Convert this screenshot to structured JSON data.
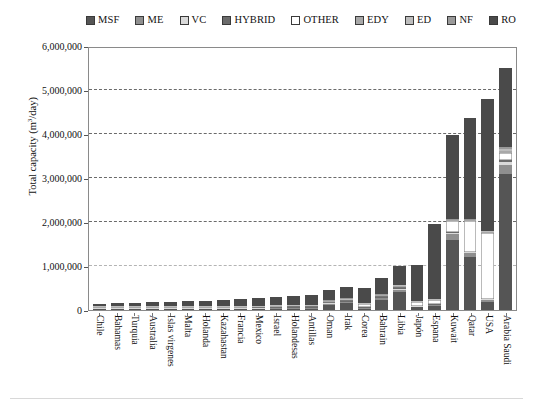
{
  "chart_data": {
    "type": "bar",
    "subtype": "stacked-bar",
    "title": "",
    "xlabel": "",
    "ylabel": "Total capacity (m3/day)",
    "ylabel_display": "Total capacity (m",
    "ylabel_sup": "3",
    "ylabel_tail": "/day)",
    "ylim": [
      0,
      6000000
    ],
    "ytick_values": [
      0,
      1000000,
      2000000,
      3000000,
      4000000,
      5000000,
      6000000
    ],
    "ytick_labels": [
      "0",
      "1,000,000",
      "2,000,000",
      "3,000,000",
      "4,000,000",
      "5,000,000",
      "6,000,000"
    ],
    "grid": "horizontal-dashed",
    "legend_position": "top",
    "categories": [
      "Chile",
      "Bahamas",
      "Turquia",
      "Australia",
      "Islas virgenes",
      "Malta",
      "Holanda",
      "Kazahastan",
      "Francia",
      "Mexico",
      "Israel",
      "Holandesas",
      "Antillas",
      "Oman",
      "Irak",
      "Corea",
      "Bahrain",
      "Libia",
      "Japón",
      "Espana",
      "Kuwait",
      "Qatar",
      "USA",
      "Arabia Saudi"
    ],
    "series": [
      {
        "name": "MSF",
        "color": "#555555",
        "values": [
          2000,
          3000,
          4000,
          6000,
          8000,
          9000,
          6000,
          9000,
          14000,
          18000,
          22000,
          26000,
          30000,
          120000,
          150000,
          30000,
          230000,
          420000,
          60000,
          90000,
          1600000,
          1200000,
          180000,
          3100000
        ]
      },
      {
        "name": "ME",
        "color": "#8f8f8f",
        "values": [
          1000,
          1000,
          1500,
          2000,
          2000,
          2500,
          2000,
          2500,
          3000,
          3500,
          4000,
          4500,
          5000,
          20000,
          25000,
          8000,
          35000,
          45000,
          15000,
          20000,
          120000,
          90000,
          40000,
          200000
        ]
      },
      {
        "name": "VC",
        "color": "#d9d9d9",
        "values": [
          500,
          700,
          900,
          1000,
          1200,
          1400,
          1200,
          1500,
          1800,
          2000,
          2200,
          2500,
          2800,
          6000,
          7000,
          4000,
          9000,
          11000,
          8000,
          10000,
          30000,
          22000,
          25000,
          60000
        ]
      },
      {
        "name": "HYBRID",
        "color": "#6b6b6b",
        "values": [
          0,
          0,
          0,
          0,
          0,
          0,
          0,
          0,
          0,
          0,
          1000,
          1000,
          1500,
          3000,
          4000,
          2000,
          5000,
          6000,
          4000,
          5000,
          18000,
          14000,
          10000,
          40000
        ]
      },
      {
        "name": "OTHER",
        "color": "#ffffff",
        "values": [
          1500,
          2000,
          2500,
          3000,
          4000,
          4500,
          5000,
          5500,
          7000,
          8000,
          9000,
          10000,
          11000,
          18000,
          22000,
          60000,
          30000,
          40000,
          70000,
          80000,
          250000,
          700000,
          1500000,
          180000
        ]
      },
      {
        "name": "EDY",
        "color": "#a8a8a8",
        "values": [
          400,
          500,
          600,
          700,
          800,
          900,
          900,
          1000,
          1200,
          1400,
          1600,
          1800,
          2000,
          4000,
          5000,
          3000,
          6000,
          7000,
          5000,
          6000,
          20000,
          16000,
          18000,
          45000
        ]
      },
      {
        "name": "ED",
        "color": "#bdbdbd",
        "values": [
          300,
          400,
          500,
          600,
          700,
          800,
          800,
          900,
          1000,
          1200,
          1400,
          1600,
          1800,
          3500,
          4500,
          2500,
          5500,
          6500,
          4500,
          5500,
          18000,
          14000,
          16000,
          38000
        ]
      },
      {
        "name": "NF",
        "color": "#9a9a9a",
        "values": [
          200,
          300,
          400,
          500,
          600,
          700,
          700,
          800,
          900,
          1000,
          1200,
          1400,
          1600,
          3000,
          4000,
          2000,
          5000,
          6000,
          4000,
          5000,
          15000,
          12000,
          14000,
          32000
        ]
      },
      {
        "name": "RO",
        "color": "#4a4a4a",
        "values": [
          50000,
          60000,
          72000,
          85000,
          95000,
          105000,
          120000,
          130000,
          150000,
          165000,
          180000,
          195000,
          215000,
          240000,
          265000,
          320000,
          360000,
          420000,
          800000,
          1700000,
          1900000,
          2300000,
          3000000,
          1800000
        ]
      }
    ],
    "totals": [
      55900,
      67900,
      82400,
      98800,
      112300,
      124800,
      136600,
      151200,
      178900,
      200100,
      221400,
      243800,
      270700,
      417500,
      486500,
      431500,
      685500,
      961500,
      970500,
      1921500,
      3971000,
      4368000,
      4803000,
      5495000
    ]
  },
  "legend": {
    "items": [
      {
        "label": "MSF",
        "color": "#555555",
        "border": "#3a3a3a"
      },
      {
        "label": "ME",
        "color": "#8f8f8f",
        "border": "#3a3a3a"
      },
      {
        "label": "VC",
        "color": "#d9d9d9",
        "border": "#3a3a3a"
      },
      {
        "label": "HYBRID",
        "color": "#6b6b6b",
        "border": "#3a3a3a"
      },
      {
        "label": "OTHER",
        "color": "#ffffff",
        "border": "#3a3a3a"
      },
      {
        "label": "EDY",
        "color": "#a8a8a8",
        "border": "#3a3a3a"
      },
      {
        "label": "ED",
        "color": "#bdbdbd",
        "border": "#3a3a3a"
      },
      {
        "label": "NF",
        "color": "#9a9a9a",
        "border": "#3a3a3a"
      },
      {
        "label": "RO",
        "color": "#4a4a4a",
        "border": "#3a3a3a"
      }
    ]
  }
}
